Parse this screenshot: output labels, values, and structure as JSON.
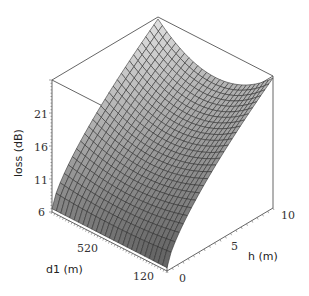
{
  "chart_data": {
    "type": "surface3d",
    "title": "",
    "xlabel": "d1 (m)",
    "ylabel": "h (m)",
    "zlabel": "loss (dB)",
    "x_axis": {
      "name": "d1",
      "range": [
        120,
        920
      ],
      "tick_labels": [
        "120",
        "520"
      ],
      "tick_values": [
        120,
        520
      ]
    },
    "y_axis": {
      "name": "h",
      "range": [
        0,
        10
      ],
      "tick_labels": [
        "0",
        "5",
        "10"
      ],
      "tick_values": [
        0,
        5,
        10
      ]
    },
    "z_axis": {
      "name": "loss",
      "range": [
        6,
        26
      ],
      "tick_labels": [
        "6",
        "11",
        "16",
        "21"
      ],
      "tick_values": [
        6,
        11,
        16,
        21
      ]
    },
    "surface_model": {
      "description": "loss rises with h (concave), bowl-shaped along d1 at high h",
      "z0": 6.5,
      "h_exponent": 0.7,
      "A": 14.8,
      "B": 17.6,
      "grid": [
        26,
        26
      ]
    },
    "corner_values": [
      {
        "d1": 120,
        "h": 0,
        "loss": 6.8
      },
      {
        "d1": 920,
        "h": 0,
        "loss": 6.5
      },
      {
        "d1": 120,
        "h": 10,
        "loss": 25.7
      },
      {
        "d1": 920,
        "h": 10,
        "loss": 26.0
      },
      {
        "d1": 520,
        "h": 10,
        "loss": 21.3
      }
    ],
    "colors": {
      "surface_light": "#e8e8e8",
      "surface_dark": "#6e6e6e",
      "mesh": "#2a2a2a",
      "box": "#555555"
    },
    "projection": {
      "origin": [
        167,
        271
      ],
      "d1_vec": [
        -115,
        -59
      ],
      "h_vec": [
        106,
        -63
      ],
      "z_px_per_unit": 6.6
    }
  },
  "labels": {
    "z_title": "loss (dB)",
    "x_title": "d1 (m)",
    "y_title": "h (m)"
  }
}
